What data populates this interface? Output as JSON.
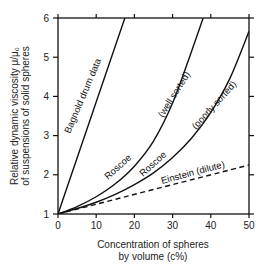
{
  "chart_data": {
    "type": "line",
    "title": "",
    "xlabel": "Concentration of spheres by volume (c%)",
    "xlabel_lines": [
      "Concentration of spheres",
      "by volume  (c%)"
    ],
    "ylabel": "Relative dynamic viscosity μ/μ0 of suspensions of solid spheres",
    "ylabel_lines": [
      "Relative dynamic viscosity μ/μ₀",
      "of suspensions of solid spheres"
    ],
    "xlim": [
      0,
      50
    ],
    "ylim": [
      1,
      6
    ],
    "xticks": [
      "0",
      "10",
      "20",
      "30",
      "40",
      "50"
    ],
    "yticks": [
      "1",
      "2",
      "3",
      "4",
      "5",
      "6"
    ],
    "grid": false,
    "legend": "inline labels",
    "series": [
      {
        "name": "Bagnold drum data",
        "style": "solid",
        "x": [
          0,
          17.5
        ],
        "y": [
          1,
          6
        ]
      },
      {
        "name": "Roscoe (well sorted)",
        "style": "solid",
        "x": [
          0,
          5,
          10,
          15,
          20,
          25,
          30,
          35,
          38
        ],
        "y": [
          1,
          1.19,
          1.44,
          1.77,
          2.22,
          2.86,
          3.83,
          5.16,
          6.0
        ]
      },
      {
        "name": "Roscoe (poorly sorted)",
        "style": "solid",
        "x": [
          0,
          5,
          10,
          15,
          20,
          25,
          30,
          35,
          40,
          45,
          50
        ],
        "y": [
          1,
          1.14,
          1.3,
          1.5,
          1.75,
          2.05,
          2.44,
          2.94,
          3.59,
          4.46,
          5.66
        ]
      },
      {
        "name": "Einstein (dilute)",
        "style": "dashed",
        "x": [
          0,
          50
        ],
        "y": [
          1,
          2.25
        ]
      }
    ],
    "annotations": [
      "Bagnold drum data",
      "Roscoe",
      "(well sorted)",
      "Roscoe",
      "(poorly sorted)",
      "Einstein (dilute)"
    ]
  }
}
